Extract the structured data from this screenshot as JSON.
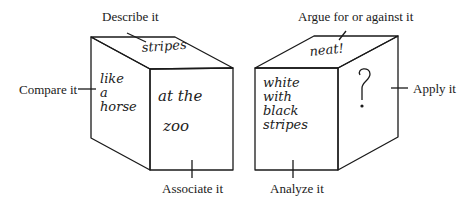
{
  "diagram": {
    "cubes": [
      {
        "id": "left",
        "faces": {
          "top": [
            "stripes"
          ],
          "left": [
            "like",
            "a",
            "horse"
          ],
          "front": [
            "at the",
            "zoo"
          ]
        }
      },
      {
        "id": "right",
        "faces": {
          "top": [
            "neat!"
          ],
          "front": [
            "white",
            "with",
            "black",
            "stripes"
          ],
          "right": [
            "?"
          ]
        }
      }
    ],
    "labels": {
      "describe": "Describe it",
      "compare": "Compare it",
      "associate": "Associate it",
      "argue": "Argue for or against it",
      "apply": "Apply it",
      "analyze": "Analyze it"
    },
    "colors": {
      "line": "#1a1a1a",
      "background": "#ffffff"
    }
  }
}
